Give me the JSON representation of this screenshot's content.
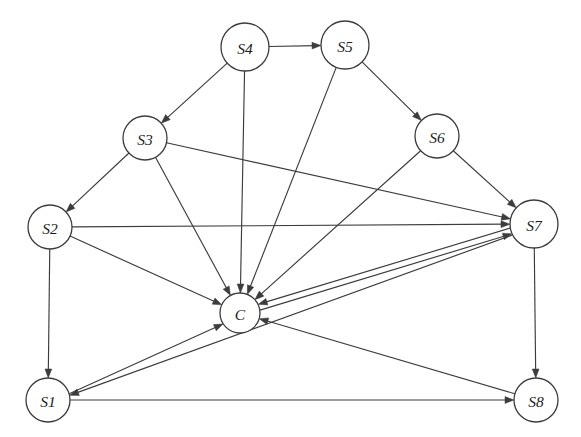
{
  "diagram": {
    "canvas": {
      "width": 581,
      "height": 437,
      "background": "#ffffff"
    },
    "style": {
      "edge_color": "#3c3c3c",
      "node_fill": "#ffffff",
      "node_stroke": "#3c3c3c",
      "label_color": "#1c1c1c",
      "edge_width": 1.15,
      "node_stroke_width": 1.3
    },
    "nodes": [
      {
        "id": "S1",
        "label": "S1",
        "x": 48,
        "y": 400,
        "r": 22
      },
      {
        "id": "S2",
        "label": "S2",
        "x": 50,
        "y": 227,
        "r": 22
      },
      {
        "id": "S3",
        "label": "S3",
        "x": 145,
        "y": 138,
        "r": 22
      },
      {
        "id": "S4",
        "label": "S4",
        "x": 245,
        "y": 47,
        "r": 24
      },
      {
        "id": "S5",
        "label": "S5",
        "x": 345,
        "y": 45,
        "r": 24
      },
      {
        "id": "S6",
        "label": "S6",
        "x": 437,
        "y": 136,
        "r": 22
      },
      {
        "id": "S7",
        "label": "S7",
        "x": 534,
        "y": 224,
        "r": 24
      },
      {
        "id": "S8",
        "label": "S8",
        "x": 536,
        "y": 400,
        "r": 22
      },
      {
        "id": "C",
        "label": "C",
        "x": 240,
        "y": 313,
        "r": 20
      }
    ],
    "edges": [
      {
        "from": "S4",
        "to": "S5",
        "arrow": "to",
        "offset": 0
      },
      {
        "from": "S4",
        "to": "S3",
        "arrow": "to",
        "offset": 0
      },
      {
        "from": "S4",
        "to": "C",
        "arrow": "to",
        "offset": 0
      },
      {
        "from": "S5",
        "to": "S6",
        "arrow": "to",
        "offset": 0
      },
      {
        "from": "S5",
        "to": "C",
        "arrow": "to",
        "offset": 0
      },
      {
        "from": "S3",
        "to": "S2",
        "arrow": "to",
        "offset": 0
      },
      {
        "from": "S3",
        "to": "S7",
        "arrow": "to",
        "offset": 0
      },
      {
        "from": "S3",
        "to": "C",
        "arrow": "to",
        "offset": 0
      },
      {
        "from": "S6",
        "to": "S7",
        "arrow": "to",
        "offset": 0
      },
      {
        "from": "S6",
        "to": "C",
        "arrow": "to",
        "offset": 0
      },
      {
        "from": "S2",
        "to": "S7",
        "arrow": "to",
        "offset": 0
      },
      {
        "from": "S2",
        "to": "C",
        "arrow": "to",
        "offset": 0
      },
      {
        "from": "S2",
        "to": "S1",
        "arrow": "to",
        "offset": 0
      },
      {
        "from": "S1",
        "to": "C",
        "arrow": "to",
        "offset": 3
      },
      {
        "from": "S1",
        "to": "S8",
        "arrow": "to",
        "offset": 0
      },
      {
        "from": "S7",
        "to": "S1",
        "arrow": "to",
        "offset": -3
      },
      {
        "from": "S7",
        "to": "C",
        "arrow": "to",
        "offset": 3
      },
      {
        "from": "S7",
        "to": "S8",
        "arrow": "to",
        "offset": 0
      },
      {
        "from": "C",
        "to": "S7",
        "arrow": "to",
        "offset": 3
      },
      {
        "from": "S8",
        "to": "C",
        "arrow": "to",
        "offset": 0
      }
    ]
  }
}
